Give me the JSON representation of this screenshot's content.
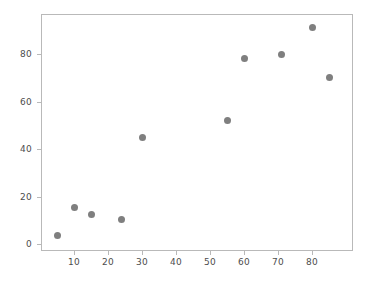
{
  "chart_data": {
    "type": "scatter",
    "title": "",
    "xlabel": "",
    "ylabel": "",
    "xlim": [
      0.3,
      92
    ],
    "ylim": [
      -3.5,
      96
    ],
    "grid": false,
    "legend": null,
    "marker_color": "#7f7f7f",
    "frame_color": "#b9b9b9",
    "background_color": "#ffffff",
    "xticks": [
      10,
      20,
      30,
      40,
      50,
      60,
      70,
      80
    ],
    "yticks": [
      0,
      20,
      40,
      60,
      80
    ],
    "xtick_labels": [
      "10",
      "20",
      "30",
      "40",
      "50",
      "60",
      "70",
      "80"
    ],
    "ytick_labels": [
      "0",
      "20",
      "40",
      "60",
      "80"
    ],
    "points": [
      {
        "x": 5,
        "y": 3.5
      },
      {
        "x": 10,
        "y": 15.5
      },
      {
        "x": 15,
        "y": 12.5
      },
      {
        "x": 24,
        "y": 10.5
      },
      {
        "x": 30,
        "y": 45
      },
      {
        "x": 55,
        "y": 52
      },
      {
        "x": 60,
        "y": 78
      },
      {
        "x": 71,
        "y": 80
      },
      {
        "x": 80,
        "y": 91
      },
      {
        "x": 85,
        "y": 70
      }
    ]
  }
}
